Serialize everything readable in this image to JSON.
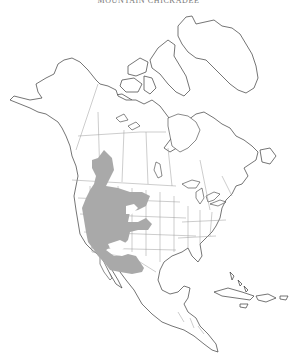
{
  "map": {
    "title": "Mountain Chickadee",
    "region": "North America",
    "legend": {
      "range_color": "#a9a9a9",
      "range_label": "Year-round range"
    },
    "colors": {
      "land_fill": "#ffffff",
      "coastline": "#3a3a3a",
      "political_borders": "#9a9a9a",
      "background": "#ffffff"
    }
  }
}
